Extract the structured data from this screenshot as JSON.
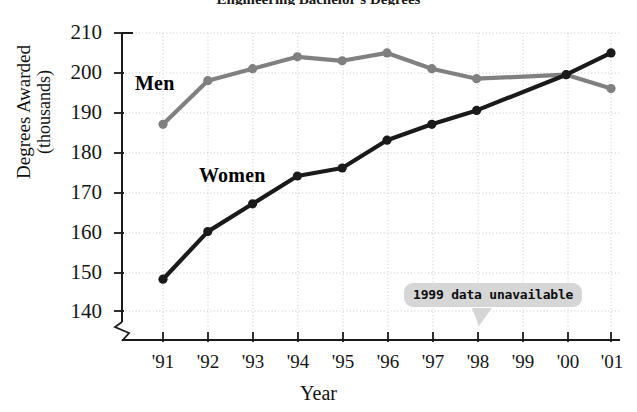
{
  "chart_data": {
    "type": "line",
    "title": "Engineering Bachelor's Degrees",
    "xlabel": "Year",
    "ylabel": "Degrees Awarded (thousands)",
    "ylabel_line1": "Degrees Awarded",
    "ylabel_line2": "(thousands)",
    "categories": [
      "'91",
      "'92",
      "'93",
      "'94",
      "'95",
      "'96",
      "'97",
      "'98",
      "'99",
      "'00",
      "'01"
    ],
    "x_values": [
      1991,
      1992,
      1993,
      1994,
      1995,
      1996,
      1997,
      1998,
      1999,
      2000,
      2001
    ],
    "ylim": [
      140,
      210
    ],
    "yticks": [
      140,
      150,
      160,
      170,
      180,
      190,
      200,
      210
    ],
    "ytick_labels": [
      "140",
      "150",
      "160",
      "170",
      "180",
      "190",
      "200",
      "210"
    ],
    "y_axis_break": true,
    "grid": true,
    "legend_position": "inline-labels",
    "series": [
      {
        "name": "Men",
        "color": "#808080",
        "marker": "circle",
        "values": [
          187,
          198,
          201,
          204,
          203,
          205,
          201,
          198.5,
          null,
          199.5,
          196
        ]
      },
      {
        "name": "Women",
        "color": "#1a1a1a",
        "marker": "circle",
        "values": [
          148,
          160,
          167,
          174,
          176,
          183,
          187,
          190.5,
          null,
          199.5,
          205
        ]
      }
    ],
    "annotations": [
      {
        "text": "1999 data unavailable",
        "points_to": "'99",
        "background": "#d6d6d6"
      }
    ]
  },
  "colors": {
    "men_series": "#808080",
    "women_series": "#1a1a1a",
    "grid": "#c8c8c8",
    "axis": "#1a1a1a",
    "callout_bg": "#d6d6d6",
    "background": "#ffffff"
  }
}
